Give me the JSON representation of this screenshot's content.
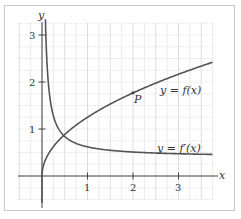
{
  "chart_data": {
    "type": "line",
    "title": "",
    "xlabel": "x",
    "ylabel": "y",
    "xlim": [
      -0.5,
      3.75
    ],
    "ylim": [
      -0.5,
      3.25
    ],
    "grid": true,
    "x_ticks": [
      1,
      2,
      3
    ],
    "y_ticks": [
      1,
      2,
      3
    ],
    "series": [
      {
        "name": "y = f(x)",
        "label": "y = f(x)",
        "formula": "1.25*sqrt(x)",
        "x": [
          0,
          0.25,
          0.5,
          1,
          1.5,
          2,
          2.5,
          3,
          3.5,
          3.75
        ],
        "values": [
          0,
          0.63,
          0.88,
          1.25,
          1.53,
          1.77,
          1.98,
          2.17,
          2.34,
          2.42
        ],
        "color": "#555555"
      },
      {
        "name": "y = f'(x)",
        "label": "y = f′(x)",
        "formula": "0.4 + 0.22/x",
        "x": [
          0.07,
          0.1,
          0.25,
          0.5,
          1,
          1.5,
          2,
          2.5,
          3,
          3.75
        ],
        "values": [
          3.5,
          2.6,
          1.28,
          0.84,
          0.62,
          0.55,
          0.51,
          0.49,
          0.47,
          0.46
        ],
        "color": "#555555"
      }
    ],
    "annotations": [
      {
        "text": "P",
        "x": 2,
        "y": 1.77,
        "type": "point"
      }
    ],
    "legend": "inline labels"
  },
  "labels": {
    "x_axis": "x",
    "y_axis": "y",
    "f_label": "y = f(x)",
    "fprime_label": "y = f′(x)",
    "point_label": "P",
    "tick_x1": "1",
    "tick_x2": "2",
    "tick_x3": "3",
    "tick_y1": "1",
    "tick_y2": "2",
    "tick_y3": "3"
  }
}
